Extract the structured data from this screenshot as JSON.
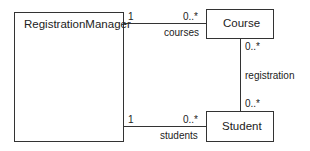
{
  "diagram": {
    "type": "UML class diagram",
    "classes": [
      {
        "id": "registration-manager",
        "name": "RegistrationManager"
      },
      {
        "id": "course",
        "name": "Course"
      },
      {
        "id": "student",
        "name": "Student"
      }
    ],
    "associations": [
      {
        "from": "RegistrationManager",
        "to": "Course",
        "role": "courses",
        "from_mult": "1",
        "to_mult": "0..*"
      },
      {
        "from": "RegistrationManager",
        "to": "Student",
        "role": "students",
        "from_mult": "1",
        "to_mult": "0..*"
      },
      {
        "from": "Course",
        "to": "Student",
        "role": "registration",
        "from_mult": "0..*",
        "to_mult": "0..*"
      }
    ]
  },
  "labels": {
    "rm_course_from_mult": "1",
    "rm_course_to_mult": "0..*",
    "rm_course_role": "courses",
    "rm_student_from_mult": "1",
    "rm_student_to_mult": "0..*",
    "rm_student_role": "students",
    "course_student_top_mult": "0..*",
    "course_student_bottom_mult": "0..*",
    "course_student_role": "registration"
  }
}
